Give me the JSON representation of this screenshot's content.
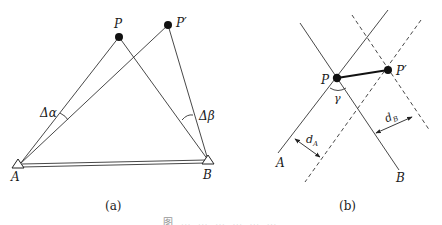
{
  "figure": {
    "panel_a": {
      "label": "(a)",
      "points": {
        "P": "P",
        "P_prime": "P′",
        "A": "A",
        "B": "B"
      },
      "angles": {
        "delta_alpha": "Δα",
        "delta_beta": "Δβ"
      }
    },
    "panel_b": {
      "label": "(b)",
      "points": {
        "P": "P",
        "P_prime": "P′",
        "A": "A",
        "B": "B"
      },
      "angle": "γ",
      "distances": {
        "d_A": "d",
        "d_A_sub": "A",
        "d_B": "d",
        "d_B_sub": "B"
      }
    },
    "caption": "图 … … … … … …"
  }
}
